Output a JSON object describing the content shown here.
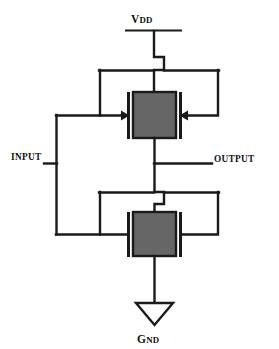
{
  "diagram": {
    "type": "circuit-schematic",
    "background_color": "#ffffff",
    "wire_color": "#1a1a1a",
    "device_fill_color": "#666666"
  },
  "labels": {
    "vdd": {
      "lead": "V",
      "trail": "DD",
      "full": "VDD"
    },
    "gnd": {
      "lead": "G",
      "trail": "ND",
      "full": "GND"
    },
    "input": "INPUT",
    "output": "OUTPUT"
  },
  "nodes": [
    {
      "name": "vdd-rail",
      "label": "VDD",
      "role": "power-supply"
    },
    {
      "name": "gnd-symbol",
      "label": "GND",
      "role": "ground"
    },
    {
      "name": "input-terminal",
      "label": "INPUT",
      "role": "signal-input"
    },
    {
      "name": "output-terminal",
      "label": "OUTPUT",
      "role": "signal-output"
    }
  ],
  "devices": [
    {
      "name": "pmos-transistor",
      "type": "PMOS",
      "position": "top",
      "gates": 2,
      "gate_arrows": "inward",
      "fill": "#666666"
    },
    {
      "name": "nmos-transistor",
      "type": "NMOS",
      "position": "bottom",
      "gates": 2,
      "gate_arrows": "none",
      "fill": "#666666"
    }
  ]
}
